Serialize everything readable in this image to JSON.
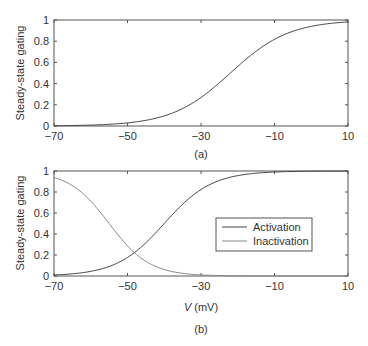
{
  "chart_data": [
    {
      "type": "line",
      "panel_label": "(a)",
      "title": "",
      "xlabel": "",
      "ylabel": "Steady-state gating",
      "xlim": [
        -70,
        10
      ],
      "ylim": [
        0,
        1
      ],
      "xticks": [
        -70,
        -50,
        -30,
        -10,
        10
      ],
      "xtick_labels": [
        "−70",
        "−50",
        "−30",
        "−10",
        "10"
      ],
      "yticks": [
        0,
        0.2,
        0.4,
        0.6,
        0.8,
        1
      ],
      "ytick_labels": [
        "0",
        "0.2",
        "0.4",
        "0.6",
        "0.8",
        "1"
      ],
      "grid": false,
      "legend": null,
      "series": [
        {
          "name": "Activation",
          "color": "#444444",
          "boltzmann": {
            "v_half": -22,
            "k": 8,
            "direction": "increasing"
          },
          "x": [
            -70,
            -60,
            -50,
            -40,
            -30,
            -22,
            -20,
            -10,
            0,
            10
          ],
          "y": [
            0.002,
            0.009,
            0.03,
            0.095,
            0.27,
            0.5,
            0.56,
            0.82,
            0.94,
            0.98
          ]
        }
      ]
    },
    {
      "type": "line",
      "panel_label": "(b)",
      "title": "",
      "xlabel": "V (mV)",
      "xlabel_italic_part": "V",
      "xlabel_rest": " (mV)",
      "ylabel": "Steady-state gating",
      "xlim": [
        -70,
        10
      ],
      "ylim": [
        0,
        1
      ],
      "xticks": [
        -70,
        -50,
        -30,
        -10,
        10
      ],
      "xtick_labels": [
        "−70",
        "−50",
        "−30",
        "−10",
        "10"
      ],
      "yticks": [
        0,
        0.2,
        0.4,
        0.6,
        0.8,
        1
      ],
      "ytick_labels": [
        "0",
        "0.2",
        "0.4",
        "0.6",
        "0.8",
        "1"
      ],
      "grid": false,
      "legend": {
        "position": "center-right",
        "entries": [
          "Activation",
          "Inactivation"
        ]
      },
      "series": [
        {
          "name": "Activation",
          "color": "#444444",
          "boltzmann": {
            "v_half": -40,
            "k": 6.5,
            "direction": "increasing"
          },
          "x": [
            -70,
            -60,
            -50,
            -47,
            -40,
            -30,
            -20,
            -10,
            0,
            10
          ],
          "y": [
            0.01,
            0.04,
            0.18,
            0.25,
            0.5,
            0.82,
            0.95,
            0.99,
            1.0,
            1.0
          ]
        },
        {
          "name": "Inactivation",
          "color": "#888888",
          "boltzmann": {
            "v_half": -55,
            "k": 5.5,
            "direction": "decreasing"
          },
          "x": [
            -70,
            -60,
            -55,
            -50,
            -47,
            -40,
            -30,
            -20,
            -10
          ],
          "y": [
            0.94,
            0.71,
            0.5,
            0.29,
            0.19,
            0.06,
            0.01,
            0.0,
            0.0
          ]
        }
      ]
    }
  ],
  "panels": {
    "a": {
      "label": "(a)",
      "ylabel": "Steady-state gating"
    },
    "b": {
      "label": "(b)",
      "ylabel": "Steady-state gating",
      "xlabel_v": "V",
      "xlabel_unit": " (mV)",
      "legend": {
        "activation": "Activation",
        "inactivation": "Inactivation"
      }
    }
  },
  "colors": {
    "activation": "#444444",
    "inactivation": "#8a8a8a",
    "axis": "#555555"
  }
}
